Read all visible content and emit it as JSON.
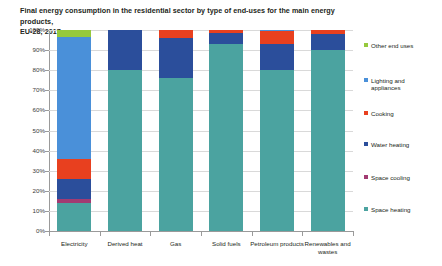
{
  "chart_data": {
    "type": "bar",
    "subtype": "stacked-percentage-column",
    "title_lines": [
      "Final energy consumption in the residential sector by type of end-uses for the main energy products,",
      "EU-28, 2017"
    ],
    "xlabel": "",
    "ylabel": "",
    "ylim": [
      0,
      100
    ],
    "y_unit": "%",
    "ytick_labels": [
      "0%",
      "10%",
      "20%",
      "30%",
      "40%",
      "50%",
      "60%",
      "70%",
      "80%",
      "90%",
      "100%"
    ],
    "ytick_values": [
      0,
      10,
      20,
      30,
      40,
      50,
      60,
      70,
      80,
      90,
      100
    ],
    "grid": true,
    "legend_position": "right",
    "categories": [
      "Electricity",
      "Derived heat",
      "Gas",
      "Solid fuels",
      "Petroleum products",
      "Renewables and wastes"
    ],
    "category_label_lines": [
      [
        "Electricity"
      ],
      [
        "Derived heat"
      ],
      [
        "Gas"
      ],
      [
        "Solid fuels"
      ],
      [
        "Petroleum products"
      ],
      [
        "Renewables and",
        "wastes"
      ]
    ],
    "series": [
      {
        "name": "Space heating",
        "color": "#4BA3A0",
        "values": [
          14.0,
          80.0,
          76.0,
          93.0,
          80.0,
          90.0
        ]
      },
      {
        "name": "Space cooling",
        "color": "#A23B72",
        "values": [
          2.0,
          0.0,
          0.0,
          0.0,
          0.0,
          0.0
        ]
      },
      {
        "name": "Water heating",
        "color": "#2B4E9B",
        "values": [
          10.0,
          20.0,
          20.0,
          5.5,
          13.0,
          8.0
        ]
      },
      {
        "name": "Cooking",
        "color": "#E8401F",
        "values": [
          10.0,
          0.0,
          4.0,
          1.5,
          6.5,
          2.0
        ]
      },
      {
        "name": "Lighting and appliances",
        "color": "#4A90D9",
        "values": [
          60.5,
          0.0,
          0.0,
          0.0,
          0.5,
          0.0
        ]
      },
      {
        "name": "Other end uses",
        "color": "#96C93D",
        "values": [
          3.5,
          0.0,
          0.0,
          0.0,
          0.0,
          0.0
        ]
      }
    ]
  },
  "legend": {
    "items": [
      {
        "label": "Other end uses",
        "label_lines": [
          "Other end uses"
        ],
        "color": "#96C93D"
      },
      {
        "label": "Lighting and appliances",
        "label_lines": [
          "Lighting and",
          "appliances"
        ],
        "color": "#4A90D9"
      },
      {
        "label": "Cooking",
        "label_lines": [
          "Cooking"
        ],
        "color": "#E8401F"
      },
      {
        "label": "Water heating",
        "label_lines": [
          "Water heating"
        ],
        "color": "#2B4E9B"
      },
      {
        "label": "Space cooling",
        "label_lines": [
          "Space cooling"
        ],
        "color": "#A23B72"
      },
      {
        "label": "Space heating",
        "label_lines": [
          "Space heating"
        ],
        "color": "#4BA3A0"
      }
    ]
  },
  "colors": {
    "background": "#ffffff",
    "gridline": "#d9d9d9",
    "axis": "#9a9a9a",
    "text": "#231f20"
  }
}
